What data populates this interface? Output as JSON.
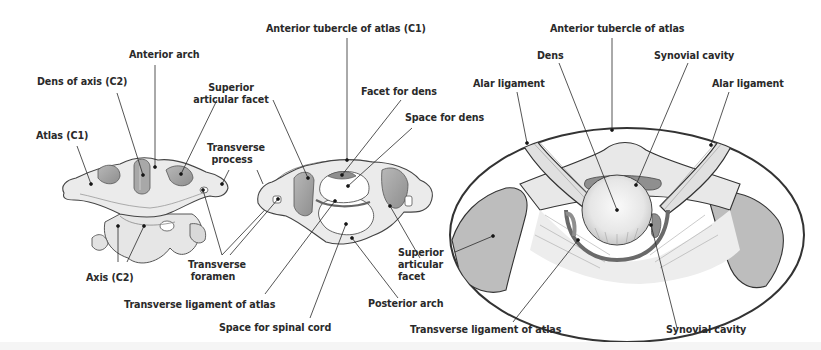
{
  "figure": {
    "panels": [
      {
        "id": "panel-1",
        "subject": "Atlas and axis articulated (anterolateral view)",
        "labels": {
          "anterior_arch": "Anterior arch",
          "dens_of_axis": "Dens of axis (C2)",
          "atlas": "Atlas (C1)",
          "superior_articular_facet": "Superior articular facet",
          "transverse_process": "Transverse process",
          "transverse_foramen": "Transverse foramen",
          "axis": "Axis (C2)"
        }
      },
      {
        "id": "panel-2",
        "subject": "Atlas (superior view)",
        "labels": {
          "anterior_tubercle": "Anterior tubercle of atlas (C1)",
          "facet_for_dens": "Facet for dens",
          "space_for_dens": "Space for dens",
          "superior_articular_facet": "Superior articular facet",
          "posterior_arch": "Posterior arch",
          "transverse_ligament": "Transverse ligament of atlas",
          "space_for_spinal_cord": "Space for spinal cord"
        }
      },
      {
        "id": "panel-3",
        "subject": "Magnified median atlanto-axial joint",
        "labels": {
          "anterior_tubercle": "Anterior tubercle of atlas",
          "dens": "Dens",
          "synovial_cavity_top": "Synovial cavity",
          "alar_ligament_left": "Alar ligament",
          "alar_ligament_right": "Alar ligament",
          "transverse_ligament": "Transverse ligament of atlas",
          "synovial_cavity_bottom": "Synovial cavity"
        }
      }
    ],
    "colors": {
      "bone": "#ebebeb",
      "bone_shadow": "#c9c9c9",
      "facet": "#9a9a9a",
      "outline": "#3a3a3a",
      "leader": "#2a2a2a",
      "text": "#2a2a2a",
      "background": "#ffffff"
    }
  }
}
